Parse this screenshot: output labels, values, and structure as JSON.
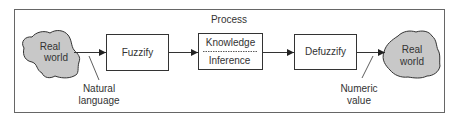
{
  "diagram": {
    "title": "Process",
    "nodes": {
      "input_world": {
        "line1": "Real",
        "line2": "world"
      },
      "fuzzify": {
        "label": "Fuzzify"
      },
      "process": {
        "top": "Knowledge",
        "bottom": "Inference"
      },
      "defuzzify": {
        "label": "Defuzzify"
      },
      "output_world": {
        "line1": "Real",
        "line2": "world"
      }
    },
    "annotations": {
      "input": {
        "line1": "Natural",
        "line2": "language"
      },
      "output": {
        "line1": "Numeric",
        "line2": "value"
      }
    },
    "edges": [
      {
        "from": "input_world",
        "to": "fuzzify"
      },
      {
        "from": "fuzzify",
        "to": "process"
      },
      {
        "from": "process",
        "to": "defuzzify"
      },
      {
        "from": "defuzzify",
        "to": "output_world"
      }
    ],
    "colors": {
      "cloud_fill": "#c8c8c8",
      "stroke": "#333333",
      "border": "#555555"
    }
  }
}
